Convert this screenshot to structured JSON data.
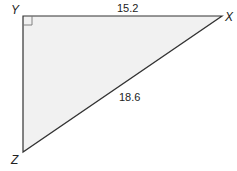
{
  "diagram": {
    "type": "right-triangle",
    "vertices": [
      {
        "name": "Y",
        "x": 23,
        "y": 16
      },
      {
        "name": "X",
        "x": 222,
        "y": 16
      },
      {
        "name": "Z",
        "x": 23,
        "y": 152
      }
    ],
    "right_angle_at": "Y",
    "sides": [
      {
        "between": "YX",
        "label": "15.2"
      },
      {
        "between": "XZ",
        "label": "18.6"
      }
    ],
    "fill_color": "#f1f1f1",
    "stroke_color": "#333333"
  },
  "labels": {
    "y": "Y",
    "x": "X",
    "z": "Z",
    "side_yx": "15.2",
    "side_xz": "18.6"
  }
}
